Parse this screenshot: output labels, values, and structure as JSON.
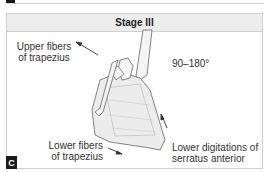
{
  "figure": {
    "panel_letter": "C",
    "title": "Stage III",
    "labels": {
      "upper_trapezius": [
        "Upper fibers",
        "of trapezius"
      ],
      "angle": "90–180°",
      "lower_trapezius": [
        "Lower fibers",
        "of trapezius"
      ],
      "serratus": [
        "Lower digitations of",
        "serratus anterior"
      ]
    },
    "illustration": "scapula-clavicle-humerus-elevation",
    "colors": {
      "header_bg": "#ededed",
      "border": "#cfcfcf",
      "badge_bg": "#1a1a1a",
      "line": "#555555"
    }
  }
}
